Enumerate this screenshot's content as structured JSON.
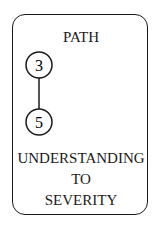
{
  "card": {
    "title": "PATH",
    "nodes": [
      {
        "label": "3"
      },
      {
        "label": "5"
      }
    ],
    "caption": {
      "line1": "UNDERSTANDING",
      "line2": "TO",
      "line3": "SEVERITY"
    }
  }
}
